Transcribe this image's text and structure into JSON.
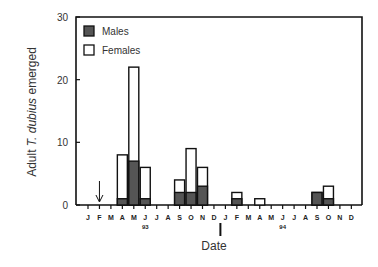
{
  "chart_data": {
    "type": "bar",
    "stacked": true,
    "title": "",
    "xlabel": "Date",
    "ylabel": "Adult T. dubius emerged",
    "ylabel_parts": [
      "Adult ",
      "T. dubius",
      " emerged"
    ],
    "ylim": [
      0,
      30
    ],
    "yticks": [
      0,
      10,
      20,
      30
    ],
    "categories": [
      "J",
      "F",
      "M",
      "A",
      "M",
      "J",
      "J",
      "A",
      "S",
      "O",
      "N",
      "D",
      "J",
      "F",
      "M",
      "A",
      "M",
      "J",
      "J",
      "A",
      "S",
      "O",
      "N",
      "D"
    ],
    "year_labels": [
      {
        "label": "93",
        "index": 5
      },
      {
        "label": "94",
        "index": 17
      }
    ],
    "series": [
      {
        "name": "Males",
        "color": "#555555",
        "values": [
          0,
          0,
          0,
          1,
          7,
          1,
          0,
          0,
          2,
          2,
          3,
          0,
          0,
          1,
          0,
          0,
          0,
          0,
          0,
          0,
          2,
          1,
          0,
          0
        ]
      },
      {
        "name": "Females",
        "color": "#ffffff",
        "values": [
          0,
          0,
          0,
          7,
          15,
          5,
          0,
          0,
          2,
          7,
          3,
          0,
          0,
          1,
          0,
          1,
          0,
          0,
          0,
          0,
          0,
          2,
          0,
          0
        ]
      }
    ],
    "annotations": [
      {
        "type": "arrow-down",
        "index": 1
      },
      {
        "type": "vertical-marker",
        "between_index": 12,
        "description": "marker below J of 1994 above Date label"
      }
    ],
    "legend": {
      "position": "upper-left",
      "entries": [
        "Males",
        "Females"
      ]
    },
    "grid": false
  }
}
